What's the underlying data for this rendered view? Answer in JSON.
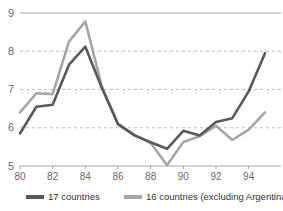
{
  "chart_data": {
    "type": "line",
    "title": "",
    "xlabel": "",
    "ylabel": "",
    "x": [
      1980,
      1981,
      1982,
      1983,
      1984,
      1985,
      1986,
      1987,
      1988,
      1989,
      1990,
      1991,
      1992,
      1993,
      1994,
      1995
    ],
    "x_tick_labels": [
      "80",
      "",
      "82",
      "",
      "84",
      "",
      "86",
      "",
      "88",
      "",
      "90",
      "",
      "92",
      "",
      "94",
      ""
    ],
    "x_ticks_shown": [
      "80",
      "82",
      "84",
      "86",
      "88",
      "90",
      "92",
      "94"
    ],
    "xlim": [
      1980,
      1995
    ],
    "ylim": [
      5,
      9
    ],
    "y_ticks": [
      5,
      6,
      7,
      8,
      9
    ],
    "grid": "horizontal-dashed",
    "legend_position": "bottom",
    "series": [
      {
        "name": "17 countries",
        "color": "#595959",
        "values": [
          5.85,
          6.55,
          6.6,
          7.65,
          8.12,
          7.05,
          6.1,
          5.8,
          5.62,
          5.45,
          5.92,
          5.8,
          6.15,
          6.25,
          6.95,
          7.95
        ]
      },
      {
        "name": "16 countries (excluding Argentina)",
        "color": "#a6a6a6",
        "values": [
          6.4,
          6.9,
          6.88,
          8.25,
          8.78,
          7.1,
          6.08,
          5.82,
          5.6,
          5.02,
          5.63,
          5.78,
          6.05,
          5.68,
          5.95,
          6.4
        ]
      }
    ]
  },
  "axis": {
    "y_labels": [
      "9",
      "8",
      "7",
      "6",
      "5"
    ],
    "x_labels": [
      "80",
      "82",
      "84",
      "86",
      "88",
      "90",
      "92",
      "94"
    ]
  },
  "legend": {
    "items": [
      {
        "label": "17 countries",
        "color": "#595959"
      },
      {
        "label": "16 countries (excluding Argentina)",
        "color": "#a6a6a6"
      }
    ]
  },
  "colors": {
    "series_dark": "#595959",
    "series_light": "#a6a6a6",
    "grid": "#bfbfbf",
    "axis": "#a6a6a6",
    "text": "#6b6b6b",
    "background": "#ffffff"
  }
}
